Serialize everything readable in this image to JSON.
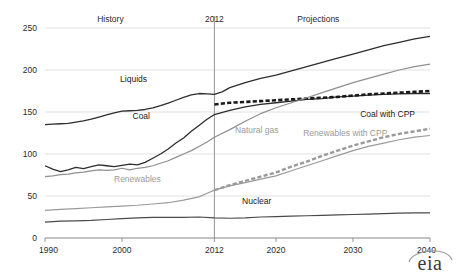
{
  "chart_data": {
    "type": "line",
    "title": "",
    "subtitle": "",
    "xlabel": "",
    "ylabel": "",
    "xlim": [
      1990,
      2040
    ],
    "ylim": [
      0,
      250
    ],
    "grid": true,
    "legend_position": "inline-annotations",
    "x_ticks": [
      "1990",
      "2000",
      "2012",
      "2020",
      "2030",
      "2040"
    ],
    "x_tick_values": [
      1990,
      2000,
      2012,
      2020,
      2030,
      2040
    ],
    "y_ticks": [
      "0",
      "50",
      "100",
      "150",
      "200",
      "250"
    ],
    "y_tick_values": [
      0,
      50,
      100,
      150,
      200,
      250
    ],
    "region_labels": [
      {
        "text": "History",
        "x": 1998.5
      },
      {
        "text": "2012",
        "x": 2012
      },
      {
        "text": "Projections",
        "x": 2025.5
      }
    ],
    "divider_year": 2012,
    "series": [
      {
        "name": "Liquids",
        "label": "Liquids",
        "color": "#2d2d2d",
        "style": "solid",
        "width": 1.3,
        "label_x": 2001.5,
        "label_y": 186,
        "label_anchor": "middle",
        "x": [
          1990,
          1991,
          1992,
          1993,
          1994,
          1995,
          1996,
          1997,
          1998,
          1999,
          2000,
          2001,
          2002,
          2003,
          2004,
          2005,
          2006,
          2007,
          2008,
          2009,
          2010,
          2011,
          2012,
          2013,
          2014,
          2016,
          2018,
          2020,
          2022,
          2024,
          2026,
          2028,
          2030,
          2032,
          2034,
          2036,
          2038,
          2040
        ],
        "values": [
          135,
          135.5,
          136,
          136.5,
          138,
          139.5,
          141.5,
          144,
          146.5,
          149,
          151,
          151.5,
          152,
          153,
          155,
          157.5,
          160.5,
          164,
          167.5,
          170.5,
          172,
          171.5,
          171,
          174,
          179,
          185,
          190,
          194,
          199,
          204,
          209,
          214,
          219,
          224,
          229,
          233,
          237,
          240
        ]
      },
      {
        "name": "Coal",
        "label": "Coal",
        "color": "#2d2d2d",
        "style": "solid",
        "width": 1.3,
        "label_x": 2002.5,
        "label_y": 142,
        "label_anchor": "middle",
        "x": [
          1990,
          1991,
          1992,
          1993,
          1994,
          1995,
          1996,
          1997,
          1998,
          1999,
          2000,
          2001,
          2002,
          2003,
          2004,
          2005,
          2006,
          2007,
          2008,
          2009,
          2010,
          2011,
          2012,
          2014,
          2016,
          2018,
          2020,
          2022,
          2024,
          2026,
          2028,
          2030,
          2032,
          2034,
          2036,
          2038,
          2040
        ],
        "values": [
          86,
          82,
          79,
          81,
          84,
          82.5,
          85,
          87,
          86,
          85,
          86.5,
          88,
          87,
          90,
          95,
          100,
          106,
          113,
          119,
          127,
          134,
          141,
          147,
          152,
          156,
          159,
          161,
          163,
          165,
          166,
          168,
          169,
          170,
          171,
          171.5,
          172,
          172
        ]
      },
      {
        "name": "Coal with CPP",
        "label": "Coal with CPP",
        "color": "#1a1a1a",
        "style": "dashed",
        "width": 2.6,
        "label_x": 2034.5,
        "label_y": 144,
        "label_anchor": "middle",
        "x": [
          2012,
          2014,
          2016,
          2018,
          2020,
          2022,
          2024,
          2026,
          2028,
          2030,
          2032,
          2034,
          2036,
          2038,
          2040
        ],
        "values": [
          159,
          161,
          162,
          163,
          164,
          165,
          166,
          167,
          168,
          169.5,
          171,
          172,
          173,
          174,
          175
        ]
      },
      {
        "name": "Natural gas",
        "label": "Natural gas",
        "color": "#8f8f8f",
        "style": "solid",
        "width": 1.2,
        "label_x": 2017.5,
        "label_y": 125,
        "label_anchor": "middle",
        "x": [
          1990,
          1991,
          1992,
          1993,
          1994,
          1995,
          1996,
          1997,
          1998,
          1999,
          2000,
          2001,
          2002,
          2003,
          2004,
          2005,
          2006,
          2007,
          2008,
          2009,
          2010,
          2011,
          2012,
          2014,
          2016,
          2018,
          2020,
          2022,
          2024,
          2026,
          2028,
          2030,
          2032,
          2034,
          2036,
          2038,
          2040
        ],
        "values": [
          73,
          74,
          75.5,
          76,
          77.5,
          78.5,
          80,
          81,
          80.5,
          81,
          83,
          81,
          83,
          84,
          86,
          89,
          92,
          96,
          100,
          104,
          109,
          114,
          120,
          129,
          139,
          148,
          155,
          161,
          167,
          173,
          179,
          185,
          190,
          195,
          200,
          204,
          207
        ]
      },
      {
        "name": "Renewables",
        "label": "Renewables",
        "color": "#9a9a9a",
        "style": "solid",
        "width": 1.2,
        "label_x": 2002,
        "label_y": 67,
        "label_anchor": "middle",
        "x": [
          1990,
          1992,
          1994,
          1996,
          1998,
          2000,
          2002,
          2004,
          2006,
          2008,
          2010,
          2011,
          2012,
          2014,
          2016,
          2018,
          2020,
          2022,
          2024,
          2026,
          2028,
          2030,
          2032,
          2034,
          2036,
          2038,
          2040
        ],
        "values": [
          33,
          34,
          35,
          36,
          37,
          38,
          39,
          40.5,
          42,
          45,
          49,
          53,
          57,
          62,
          66,
          70,
          74,
          80,
          86,
          92,
          98,
          104,
          109,
          113,
          117,
          120,
          122
        ]
      },
      {
        "name": "Renewables with CPP",
        "label": "Renewables with CPP",
        "color": "#9a9a9a",
        "style": "dashed",
        "width": 2.4,
        "label_x": 2029,
        "label_y": 122,
        "label_anchor": "middle",
        "x": [
          2012,
          2014,
          2016,
          2018,
          2020,
          2022,
          2024,
          2026,
          2028,
          2030,
          2032,
          2034,
          2036,
          2038,
          2040
        ],
        "values": [
          57,
          63,
          68,
          73,
          78,
          85,
          91,
          98,
          104,
          110,
          115,
          120,
          124,
          127,
          130
        ]
      },
      {
        "name": "Nuclear",
        "label": "Nuclear",
        "color": "#4a4a4a",
        "style": "solid",
        "width": 1.2,
        "label_x": 2017.5,
        "label_y": 41,
        "label_anchor": "middle",
        "x": [
          1990,
          1992,
          1994,
          1996,
          1998,
          2000,
          2002,
          2004,
          2006,
          2008,
          2010,
          2012,
          2014,
          2016,
          2018,
          2020,
          2022,
          2024,
          2026,
          2028,
          2030,
          2032,
          2034,
          2036,
          2038,
          2040
        ],
        "values": [
          19,
          20,
          20.5,
          21,
          22,
          23,
          24,
          24.5,
          24.5,
          24.5,
          25,
          24,
          23.5,
          24,
          25,
          25.5,
          26,
          26.5,
          27,
          27.5,
          28,
          28.5,
          29,
          29.5,
          29.8,
          30
        ]
      }
    ]
  },
  "logo": {
    "text": "eia"
  }
}
